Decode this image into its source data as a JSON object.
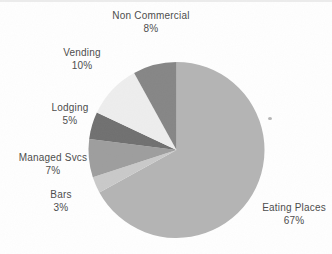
{
  "chart_data": {
    "type": "pie",
    "title": "",
    "legend": "none",
    "labels_position": "outside",
    "start_angle_deg": 0,
    "direction": "clockwise",
    "slices": [
      {
        "label": "Eating Places",
        "value": 67,
        "pct_label": "67%",
        "color": "#b4b4b4"
      },
      {
        "label": "Bars",
        "value": 3,
        "pct_label": "3%",
        "color": "#c9c9c9"
      },
      {
        "label": "Managed Svcs",
        "value": 7,
        "pct_label": "7%",
        "color": "#9d9d9d"
      },
      {
        "label": "Lodging",
        "value": 5,
        "pct_label": "5%",
        "color": "#6f6f6f"
      },
      {
        "label": "Vending",
        "value": 10,
        "pct_label": "10%",
        "color": "#eeeeee"
      },
      {
        "label": "Non Commercial",
        "value": 8,
        "pct_label": "8%",
        "color": "#858585"
      }
    ],
    "text_color": "#4d4d4d",
    "background": "#ffffff"
  }
}
